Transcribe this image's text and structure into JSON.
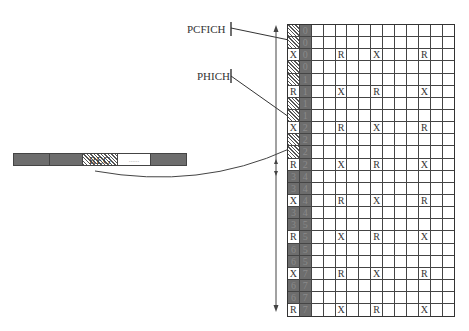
{
  "labels": {
    "pcfich": "PCFICH",
    "phich": "PHICH",
    "reg": "REG",
    "reg_dots": "......"
  },
  "reg_bar": {
    "segments": [
      {
        "type": "dark",
        "label": ""
      },
      {
        "type": "dark",
        "label": ""
      },
      {
        "type": "hatch",
        "label": "REG"
      },
      {
        "type": "white",
        "label": "......"
      },
      {
        "type": "dark",
        "label": ""
      }
    ]
  },
  "grid": {
    "columns": 14,
    "rows": [
      {
        "c0": "hatch",
        "c0_text": "",
        "c1": "0",
        "marks": {}
      },
      {
        "c0": "hatch",
        "c0_text": "",
        "c1": "0",
        "marks": {}
      },
      {
        "c0": "white",
        "c0_text": "X",
        "c1": "0",
        "marks": {
          "4": "R",
          "7": "X",
          "11": "R"
        }
      },
      {
        "c0": "hatch",
        "c0_text": "",
        "c1": "0",
        "marks": {}
      },
      {
        "c0": "hatch",
        "c0_text": "",
        "c1": "1",
        "marks": {}
      },
      {
        "c0": "white",
        "c0_text": "R",
        "c1": "1",
        "marks": {
          "4": "X",
          "7": "R",
          "11": "X"
        }
      },
      {
        "c0": "hatch",
        "c0_text": "",
        "c1": "1",
        "marks": {}
      },
      {
        "c0": "hatch",
        "c0_text": "",
        "c1": "1",
        "marks": {}
      },
      {
        "c0": "white",
        "c0_text": "X",
        "c1": "2",
        "marks": {
          "4": "R",
          "7": "X",
          "11": "R"
        }
      },
      {
        "c0": "hatch",
        "c0_text": "",
        "c1": "2",
        "marks": {}
      },
      {
        "c0": "hatch",
        "c0_text": "",
        "c1": "2",
        "marks": {}
      },
      {
        "c0": "white",
        "c0_text": "R",
        "c1": "2",
        "marks": {
          "4": "X",
          "7": "R",
          "11": "X"
        }
      },
      {
        "c0": "dark",
        "c0_text": "3",
        "c1": "4",
        "marks": {}
      },
      {
        "c0": "dark",
        "c0_text": "3",
        "c1": "4",
        "marks": {}
      },
      {
        "c0": "white",
        "c0_text": "X",
        "c1": "4",
        "marks": {
          "4": "R",
          "7": "X",
          "11": "R"
        }
      },
      {
        "c0": "dark",
        "c0_text": "3",
        "c1": "4",
        "marks": {}
      },
      {
        "c0": "dark",
        "c0_text": "3",
        "c1": "5",
        "marks": {}
      },
      {
        "c0": "white",
        "c0_text": "R",
        "c1": "5",
        "marks": {
          "4": "X",
          "7": "R",
          "11": "X"
        }
      },
      {
        "c0": "dark",
        "c0_text": "6",
        "c1": "5",
        "marks": {}
      },
      {
        "c0": "dark",
        "c0_text": "6",
        "c1": "5",
        "marks": {}
      },
      {
        "c0": "white",
        "c0_text": "X",
        "c1": "7",
        "marks": {
          "4": "R",
          "7": "X",
          "11": "R"
        }
      },
      {
        "c0": "dark",
        "c0_text": "6",
        "c1": "7",
        "marks": {}
      },
      {
        "c0": "dark",
        "c0_text": "6",
        "c1": "7",
        "marks": {}
      },
      {
        "c0": "white",
        "c0_text": "R",
        "c1": "7",
        "marks": {
          "4": "X",
          "7": "R",
          "11": "X"
        }
      }
    ]
  }
}
